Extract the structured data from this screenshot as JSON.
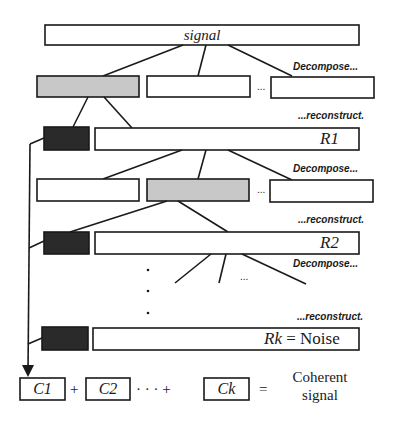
{
  "diagram": {
    "signal_label": "signal",
    "decompose_label": "Decompose...",
    "reconstruct_label": "...reconstruct.",
    "ellipsis": "...",
    "residuals": [
      {
        "label": "R1"
      },
      {
        "label": "R2"
      },
      {
        "label_var": "Rk",
        "label_rest": " = Noise"
      }
    ],
    "components": [
      {
        "label": "C1"
      },
      {
        "label": "C2"
      },
      {
        "label": "Ck"
      }
    ],
    "plus": "+",
    "dots_plus": "· · · +",
    "equals": "=",
    "result_line1": "Coherent",
    "result_line2": "signal",
    "colors": {
      "stroke": "#1a1a1a",
      "selected_fill": "#c8c8c8",
      "component_fill": "#2a2a2a",
      "box_fill": "#ffffff"
    }
  }
}
